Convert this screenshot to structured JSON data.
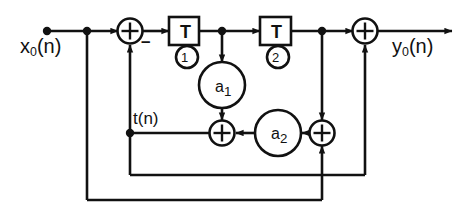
{
  "diagram": {
    "type": "signal-flow-graph",
    "canvas": {
      "width": 472,
      "height": 217
    },
    "colors": {
      "background": "#ffffff",
      "line": "#111111",
      "text": "#111111"
    },
    "labels": {
      "input": "x₀(n)",
      "input_base": "x",
      "input_sub": "0",
      "input_arg": "(n)",
      "output": "y₀(n)",
      "output_base": "y",
      "output_sub": "0",
      "output_arg": "(n)",
      "intermediate": "t(n)",
      "minus_sign": "–"
    },
    "delay_blocks": [
      {
        "name": "delay-1",
        "symbol": "T",
        "index": "1",
        "index_circled": "①"
      },
      {
        "name": "delay-2",
        "symbol": "T",
        "index": "2",
        "index_circled": "②"
      }
    ],
    "multipliers": [
      {
        "name": "coefficient-a1",
        "base": "a",
        "sub": "1",
        "label": "a₁"
      },
      {
        "name": "coefficient-a2",
        "base": "a",
        "sub": "2",
        "label": "a₂"
      }
    ],
    "adders": [
      {
        "name": "adder-input",
        "symbol": "+",
        "signs": [
          "+",
          "–"
        ]
      },
      {
        "name": "adder-middle",
        "symbol": "+",
        "signs": [
          "+",
          "+"
        ]
      },
      {
        "name": "adder-right",
        "symbol": "+",
        "signs": [
          "+",
          "+"
        ]
      },
      {
        "name": "adder-output",
        "symbol": "+",
        "signs": [
          "+",
          "+"
        ]
      }
    ],
    "nodes": [
      {
        "name": "node-input-source",
        "x": 47,
        "y": 31
      },
      {
        "name": "node-input-tap",
        "x": 87,
        "y": 31
      },
      {
        "name": "node-delay1-out-tap",
        "x": 222,
        "y": 31
      },
      {
        "name": "node-delay2-out-tap",
        "x": 322,
        "y": 31
      },
      {
        "name": "node-t-junction",
        "x": 130,
        "y": 133
      }
    ]
  }
}
